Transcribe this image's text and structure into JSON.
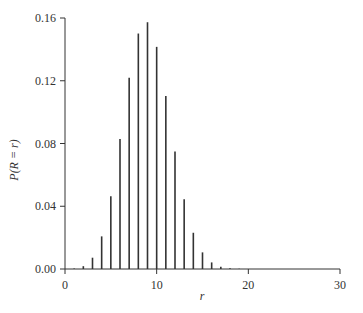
{
  "chart_data": {
    "type": "bar",
    "style": "stem",
    "title": "",
    "xlabel": "r",
    "ylabel": "P(R = r)",
    "xlim": [
      0,
      30
    ],
    "ylim": [
      0,
      0.16
    ],
    "xticks": [
      0,
      10,
      20,
      30
    ],
    "xtick_labels": [
      "0",
      "10",
      "20",
      "30"
    ],
    "yticks": [
      0,
      0.04,
      0.08,
      0.12,
      0.16
    ],
    "ytick_labels": [
      "0.00",
      "0.04",
      "0.08",
      "0.12",
      "0.16"
    ],
    "grid": false,
    "legend": null,
    "x": [
      0,
      1,
      2,
      3,
      4,
      5,
      6,
      7,
      8,
      9,
      10,
      11,
      12,
      13,
      14,
      15,
      16,
      17,
      18,
      19,
      20,
      21,
      22,
      23,
      24,
      25,
      26,
      27,
      28,
      29,
      30
    ],
    "values": [
      0.0,
      0.0003,
      0.0018,
      0.0072,
      0.0208,
      0.0464,
      0.0829,
      0.1219,
      0.1501,
      0.1573,
      0.1416,
      0.1103,
      0.0749,
      0.0444,
      0.0231,
      0.0106,
      0.0042,
      0.0015,
      0.0005,
      0.0001,
      0.0,
      0.0,
      0.0,
      0.0,
      0.0,
      0.0,
      0.0,
      0.0,
      0.0,
      0.0,
      0.0
    ],
    "color": "#333333"
  }
}
